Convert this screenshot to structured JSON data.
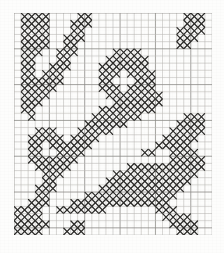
{
  "document": {
    "type": "cross-stitch-pattern-chart",
    "title": "Cross-Stitch Pattern Chart",
    "description": "Monochrome needlework charting grid with filled cross-stitch cells forming a diagonal scrolling vine motif with solid corner blocks.",
    "background_color": "#fdfdfc",
    "stitch_color": "#2b2a28",
    "grid_minor_color": "#b9b8b4",
    "grid_major_color": "#8d8c88"
  },
  "chart_data": {
    "type": "heatmap",
    "subtitle": "",
    "xlabel": "",
    "ylabel": "",
    "grid": true,
    "legend_position": "none",
    "columns": 27,
    "rows": 31,
    "cell_size": 7.2,
    "major_every": 5,
    "value_legend": [
      {
        "value": 0,
        "label": "empty",
        "symbol": ""
      },
      {
        "value": 1,
        "label": "cross stitch",
        "symbol": "X"
      }
    ],
    "x": [
      1,
      2,
      3,
      4,
      5,
      6,
      7,
      8,
      9,
      10,
      11,
      12,
      13,
      14,
      15,
      16,
      17,
      18,
      19,
      20,
      21,
      22,
      23,
      24,
      25,
      26,
      27
    ],
    "y": [
      1,
      2,
      3,
      4,
      5,
      6,
      7,
      8,
      9,
      10,
      11,
      12,
      13,
      14,
      15,
      16,
      17,
      18,
      19,
      20,
      21,
      22,
      23,
      24,
      25,
      26,
      27,
      28,
      29,
      30,
      31
    ],
    "matrix": [
      [
        0,
        1,
        1,
        1,
        1,
        0,
        0,
        0,
        0,
        1,
        1,
        0,
        0,
        0,
        0,
        0,
        0,
        0,
        0,
        0,
        0,
        0,
        0,
        0,
        1,
        1,
        1,
        0
      ],
      [
        0,
        1,
        1,
        1,
        1,
        0,
        0,
        0,
        1,
        1,
        1,
        0,
        0,
        0,
        0,
        0,
        0,
        0,
        0,
        0,
        0,
        0,
        0,
        0,
        1,
        1,
        1,
        0
      ],
      [
        0,
        1,
        1,
        1,
        1,
        0,
        0,
        0,
        1,
        1,
        0,
        0,
        0,
        0,
        0,
        0,
        0,
        0,
        0,
        0,
        0,
        0,
        0,
        1,
        1,
        1,
        1,
        0
      ],
      [
        0,
        1,
        1,
        1,
        1,
        0,
        0,
        1,
        1,
        1,
        0,
        0,
        0,
        0,
        0,
        0,
        0,
        0,
        0,
        0,
        0,
        0,
        0,
        1,
        1,
        1,
        0,
        0
      ],
      [
        0,
        1,
        1,
        1,
        1,
        0,
        0,
        1,
        1,
        0,
        0,
        0,
        0,
        0,
        0,
        0,
        0,
        0,
        0,
        0,
        0,
        0,
        0,
        1,
        1,
        0,
        0,
        0
      ],
      [
        0,
        1,
        1,
        1,
        0,
        0,
        1,
        1,
        1,
        0,
        0,
        0,
        0,
        0,
        1,
        1,
        1,
        1,
        0,
        0,
        0,
        0,
        0,
        0,
        0,
        0,
        0,
        0
      ],
      [
        0,
        1,
        1,
        0,
        0,
        0,
        1,
        1,
        0,
        0,
        0,
        0,
        0,
        1,
        1,
        1,
        1,
        1,
        1,
        0,
        0,
        0,
        0,
        0,
        0,
        0,
        0,
        0
      ],
      [
        0,
        1,
        1,
        0,
        0,
        1,
        1,
        1,
        0,
        0,
        0,
        0,
        1,
        1,
        1,
        1,
        1,
        1,
        1,
        0,
        0,
        0,
        0,
        0,
        0,
        0,
        0,
        0
      ],
      [
        0,
        1,
        1,
        0,
        1,
        1,
        1,
        0,
        0,
        0,
        0,
        0,
        1,
        1,
        1,
        0,
        1,
        1,
        1,
        1,
        0,
        0,
        0,
        0,
        0,
        0,
        0,
        0
      ],
      [
        0,
        1,
        1,
        1,
        1,
        1,
        1,
        0,
        0,
        0,
        0,
        0,
        1,
        1,
        0,
        0,
        0,
        1,
        1,
        1,
        0,
        0,
        0,
        0,
        0,
        0,
        0,
        0
      ],
      [
        0,
        1,
        1,
        1,
        1,
        1,
        0,
        0,
        0,
        0,
        0,
        0,
        1,
        1,
        1,
        0,
        1,
        1,
        1,
        1,
        0,
        0,
        0,
        0,
        0,
        0,
        0,
        0
      ],
      [
        0,
        1,
        1,
        1,
        1,
        0,
        0,
        0,
        0,
        0,
        0,
        0,
        0,
        1,
        1,
        1,
        1,
        1,
        1,
        1,
        1,
        0,
        0,
        0,
        0,
        0,
        0,
        0
      ],
      [
        0,
        1,
        1,
        1,
        0,
        0,
        0,
        0,
        0,
        0,
        0,
        0,
        0,
        0,
        1,
        1,
        1,
        1,
        1,
        1,
        1,
        0,
        0,
        0,
        0,
        0,
        0,
        0
      ],
      [
        0,
        1,
        1,
        0,
        0,
        0,
        0,
        0,
        0,
        0,
        0,
        0,
        1,
        1,
        1,
        1,
        1,
        1,
        1,
        1,
        0,
        0,
        0,
        0,
        0,
        0,
        0,
        0
      ],
      [
        0,
        0,
        1,
        0,
        0,
        0,
        0,
        0,
        0,
        0,
        0,
        1,
        1,
        1,
        1,
        1,
        1,
        1,
        0,
        0,
        0,
        0,
        0,
        0,
        1,
        1,
        1,
        0
      ],
      [
        0,
        0,
        0,
        0,
        0,
        0,
        0,
        0,
        0,
        0,
        1,
        1,
        1,
        1,
        1,
        1,
        0,
        0,
        0,
        0,
        0,
        0,
        0,
        1,
        1,
        1,
        1,
        0
      ],
      [
        0,
        0,
        0,
        1,
        1,
        1,
        0,
        0,
        0,
        1,
        1,
        1,
        1,
        1,
        0,
        0,
        0,
        0,
        0,
        0,
        0,
        0,
        1,
        1,
        1,
        1,
        1,
        0
      ],
      [
        0,
        0,
        1,
        1,
        1,
        1,
        1,
        0,
        1,
        1,
        1,
        1,
        0,
        0,
        0,
        0,
        0,
        0,
        0,
        0,
        0,
        1,
        1,
        1,
        1,
        1,
        0,
        0
      ],
      [
        0,
        0,
        1,
        1,
        0,
        1,
        1,
        1,
        1,
        1,
        1,
        0,
        0,
        0,
        0,
        0,
        0,
        0,
        0,
        0,
        1,
        1,
        1,
        1,
        1,
        0,
        0,
        0
      ],
      [
        0,
        0,
        1,
        1,
        0,
        0,
        1,
        1,
        1,
        1,
        0,
        0,
        0,
        0,
        0,
        0,
        0,
        0,
        1,
        1,
        0,
        0,
        1,
        1,
        1,
        1,
        0,
        0
      ],
      [
        0,
        0,
        1,
        1,
        1,
        1,
        1,
        1,
        1,
        0,
        0,
        0,
        0,
        0,
        0,
        0,
        0,
        0,
        0,
        0,
        0,
        0,
        1,
        1,
        1,
        1,
        1,
        0
      ],
      [
        0,
        0,
        0,
        1,
        1,
        1,
        1,
        1,
        0,
        0,
        0,
        0,
        0,
        0,
        0,
        0,
        1,
        1,
        1,
        1,
        1,
        1,
        1,
        1,
        1,
        1,
        1,
        0
      ],
      [
        0,
        0,
        0,
        0,
        1,
        1,
        1,
        0,
        0,
        0,
        0,
        0,
        0,
        0,
        1,
        1,
        1,
        1,
        1,
        1,
        1,
        1,
        1,
        1,
        1,
        1,
        0,
        0
      ],
      [
        0,
        0,
        0,
        0,
        1,
        1,
        0,
        0,
        0,
        0,
        0,
        0,
        0,
        1,
        1,
        1,
        1,
        1,
        1,
        1,
        1,
        1,
        1,
        1,
        1,
        0,
        0,
        0
      ],
      [
        0,
        0,
        0,
        1,
        1,
        1,
        0,
        0,
        0,
        0,
        0,
        0,
        1,
        1,
        1,
        1,
        1,
        1,
        1,
        1,
        1,
        1,
        1,
        1,
        0,
        0,
        0,
        0
      ],
      [
        0,
        0,
        0,
        1,
        1,
        0,
        0,
        0,
        0,
        0,
        1,
        1,
        1,
        1,
        1,
        1,
        1,
        1,
        1,
        1,
        1,
        1,
        1,
        0,
        0,
        0,
        0,
        0
      ],
      [
        0,
        0,
        1,
        1,
        1,
        0,
        0,
        0,
        1,
        1,
        1,
        1,
        1,
        1,
        1,
        1,
        1,
        1,
        1,
        1,
        1,
        1,
        0,
        0,
        0,
        0,
        0,
        0
      ],
      [
        1,
        1,
        1,
        1,
        0,
        0,
        1,
        1,
        1,
        1,
        1,
        1,
        1,
        0,
        0,
        0,
        0,
        0,
        0,
        0,
        1,
        1,
        1,
        0,
        0,
        0,
        0,
        0
      ],
      [
        1,
        1,
        1,
        1,
        0,
        0,
        0,
        0,
        0,
        0,
        0,
        0,
        0,
        0,
        0,
        0,
        0,
        0,
        0,
        0,
        0,
        1,
        1,
        1,
        1,
        0,
        0,
        0
      ],
      [
        1,
        1,
        1,
        1,
        1,
        0,
        0,
        0,
        1,
        1,
        0,
        0,
        0,
        0,
        0,
        0,
        0,
        0,
        0,
        0,
        0,
        0,
        1,
        1,
        1,
        1,
        0,
        0
      ],
      [
        1,
        1,
        1,
        1,
        0,
        0,
        0,
        1,
        1,
        1,
        0,
        0,
        0,
        0,
        0,
        0,
        0,
        0,
        0,
        0,
        0,
        0,
        0,
        1,
        1,
        1,
        0,
        0
      ]
    ]
  }
}
